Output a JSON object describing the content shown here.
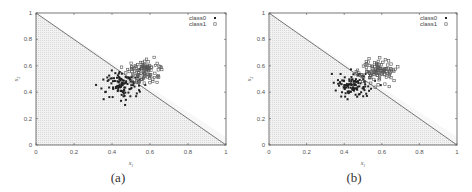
{
  "chart_data": [
    {
      "type": "scatter",
      "caption": "(a)",
      "xlabel": "x1",
      "ylabel": "x2",
      "xlim": [
        0,
        1
      ],
      "ylim": [
        0,
        1
      ],
      "xticks": [
        "0",
        "0.2",
        "0.4",
        "0.6",
        "0.8",
        "1"
      ],
      "yticks": [
        "0",
        "0.2",
        "0.4",
        "0.6",
        "0.8",
        "1"
      ],
      "grid": false,
      "legend": {
        "position": "top-right",
        "entries": [
          "class0",
          "class1"
        ]
      },
      "decision_line": {
        "from": [
          0,
          1
        ],
        "to": [
          1,
          0
        ]
      },
      "shaded_region": "below line x1 + x2 = 1 (light gray)",
      "series": [
        {
          "name": "class0",
          "marker": "filled-small-square",
          "center": [
            0.45,
            0.45
          ],
          "spread": 0.05,
          "n": 110
        },
        {
          "name": "class1",
          "marker": "open-square",
          "center": [
            0.57,
            0.56
          ],
          "spread": 0.045,
          "n": 110
        }
      ]
    },
    {
      "type": "scatter",
      "caption": "(b)",
      "xlabel": "x1",
      "ylabel": "x2",
      "xlim": [
        0,
        1
      ],
      "ylim": [
        0,
        1
      ],
      "xticks": [
        "0",
        "0.2",
        "0.4",
        "0.6",
        "0.8",
        "1"
      ],
      "yticks": [
        "0",
        "0.2",
        "0.4",
        "0.6",
        "0.8",
        "1"
      ],
      "grid": false,
      "legend": {
        "position": "top-right",
        "entries": [
          "class0",
          "class1"
        ]
      },
      "decision_line": {
        "from": [
          0,
          1
        ],
        "to": [
          1,
          0
        ]
      },
      "shaded_region": "below line x1 + x2 = 1 (light gray)",
      "series": [
        {
          "name": "class0",
          "marker": "filled-small-square",
          "center": [
            0.45,
            0.45
          ],
          "spread": 0.05,
          "n": 110
        },
        {
          "name": "class1",
          "marker": "open-square",
          "center": [
            0.57,
            0.56
          ],
          "spread": 0.045,
          "n": 110
        }
      ]
    }
  ],
  "colors": {
    "axis": "#555555",
    "line": "#666666",
    "shade": "#e6e6e6",
    "class0": "#222222",
    "class1": "#555555"
  }
}
